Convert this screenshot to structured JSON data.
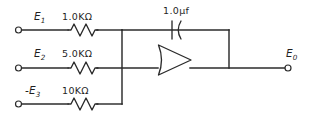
{
  "figure": {
    "kind": "schematic-diagram",
    "ink_color": "#2b2b2b",
    "background_color": "#ffffff"
  },
  "inputs": [
    {
      "id": "branch-1",
      "source_label": "E",
      "source_subscript": "1",
      "source_sign": "",
      "resistor_label": "1.0KΩ",
      "terminal": "open-circle"
    },
    {
      "id": "branch-2",
      "source_label": "E",
      "source_subscript": "2",
      "source_sign": "",
      "resistor_label": "5.0KΩ",
      "terminal": "open-circle"
    },
    {
      "id": "branch-3",
      "source_label": "E",
      "source_subscript": "3",
      "source_sign": "-",
      "resistor_label": "10KΩ",
      "terminal": "open-circle"
    }
  ],
  "feedback": {
    "component": "capacitor",
    "label": "1.0μf",
    "style": "electrolytic-curved-plate"
  },
  "amplifier": {
    "symbol": "triangle",
    "left_edge": "concave",
    "label": ""
  },
  "output": {
    "label": "E",
    "subscript": "0",
    "terminal": "open-circle"
  },
  "nodes": {
    "summing_node_label": "",
    "output_node_label": ""
  }
}
